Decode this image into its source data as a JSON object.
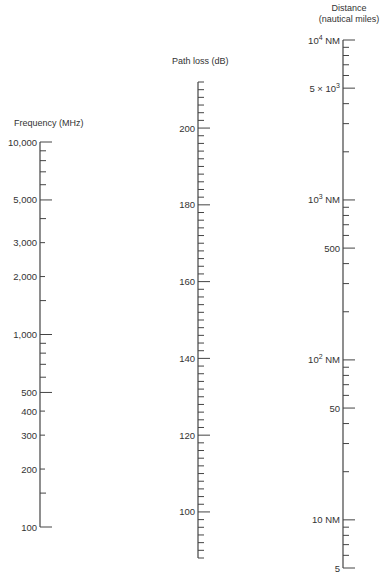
{
  "chart_data": {
    "type": "nomograph",
    "title": "",
    "scales": [
      {
        "id": "frequency",
        "title": "Frequency (MHz)",
        "kind": "log",
        "range": [
          100,
          10000
        ],
        "x": 40,
        "y_at_min": 527,
        "y_at_max": 142,
        "major_labels": [
          {
            "value": 10000,
            "text": "10,000"
          },
          {
            "value": 5000,
            "text": "5,000"
          },
          {
            "value": 3000,
            "text": "3,000"
          },
          {
            "value": 2000,
            "text": "2,000"
          },
          {
            "value": 1000,
            "text": "1,000"
          },
          {
            "value": 500,
            "text": "500"
          },
          {
            "value": 400,
            "text": "400"
          },
          {
            "value": 300,
            "text": "300"
          },
          {
            "value": 200,
            "text": "200"
          },
          {
            "value": 100,
            "text": "100"
          }
        ],
        "minor_ticks": [
          9000,
          8000,
          7000,
          6000,
          4000,
          1500,
          900,
          800,
          700,
          600,
          150
        ]
      },
      {
        "id": "path_loss",
        "title": "Path loss (dB)",
        "kind": "linear",
        "range": [
          88,
          212
        ],
        "x": 198,
        "y_at_min": 558,
        "y_at_max": 82,
        "major_labels": [
          {
            "value": 200,
            "text": "200"
          },
          {
            "value": 180,
            "text": "180"
          },
          {
            "value": 160,
            "text": "160"
          },
          {
            "value": 140,
            "text": "140"
          },
          {
            "value": 120,
            "text": "120"
          },
          {
            "value": 100,
            "text": "100"
          }
        ],
        "minor_step": 2
      },
      {
        "id": "distance",
        "title_line1": "Distance",
        "title_line2": "(nautical miles)",
        "kind": "log",
        "range": [
          5,
          10000
        ],
        "x": 343,
        "y_at_min": 568,
        "y_at_max": 40,
        "major_labels": [
          {
            "value": 10000,
            "text": "10",
            "sup": "4",
            "suffix": " NM"
          },
          {
            "value": 5000,
            "text": "5 × 10",
            "sup": "3",
            "suffix": ""
          },
          {
            "value": 1000,
            "text": "10",
            "sup": "3",
            "suffix": " NM"
          },
          {
            "value": 500,
            "text": "500",
            "sup": "",
            "suffix": ""
          },
          {
            "value": 100,
            "text": "10",
            "sup": "2",
            "suffix": " NM"
          },
          {
            "value": 50,
            "text": "50",
            "sup": "",
            "suffix": ""
          },
          {
            "value": 10,
            "text": "10 NM",
            "sup": "",
            "suffix": ""
          },
          {
            "value": 5,
            "text": "5",
            "sup": "",
            "suffix": ""
          }
        ],
        "minor_ticks": [
          9000,
          8000,
          7000,
          6000,
          4000,
          3000,
          2000,
          900,
          800,
          700,
          600,
          400,
          300,
          200,
          90,
          80,
          70,
          60,
          40,
          30,
          20,
          9,
          8,
          7,
          6
        ]
      }
    ],
    "style": {
      "line_color": "#444444",
      "text_color": "#333333",
      "background": "#ffffff"
    }
  }
}
